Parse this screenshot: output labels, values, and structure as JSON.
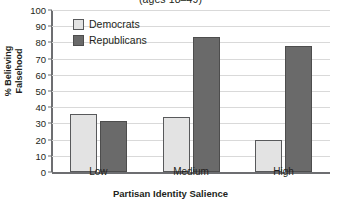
{
  "chart_data": {
    "type": "bar",
    "title": "(ages 18–49)",
    "xlabel": "Partisan Identity Salience",
    "ylabel_line1": "% Believing",
    "ylabel_line2": "Falsehood",
    "categories": [
      "Low",
      "Medium",
      "High"
    ],
    "series": [
      {
        "name": "Democrats",
        "values": [
          36,
          34,
          20
        ],
        "color": "#e3e3e3"
      },
      {
        "name": "Republicans",
        "values": [
          31.5,
          83.5,
          78
        ],
        "color": "#6a6a6a"
      }
    ],
    "ylim": [
      0,
      100
    ],
    "ytick_values": [
      0,
      10,
      20,
      30,
      40,
      50,
      60,
      70,
      80,
      90,
      100
    ],
    "ytick_labels": [
      "0",
      "10",
      "20",
      "30",
      "40",
      "50",
      "60",
      "70",
      "80",
      "90",
      "100"
    ],
    "grid": true,
    "legend_position": "upper-left-inside"
  },
  "legend": {
    "items": [
      {
        "label": "Democrats"
      },
      {
        "label": "Republicans"
      }
    ]
  },
  "axes": {
    "y_title_line1": "% Believing",
    "y_title_line2": "Falsehood",
    "x_title": "Partisan Identity Salience"
  },
  "title": {
    "text": "(ages 18–49)"
  }
}
